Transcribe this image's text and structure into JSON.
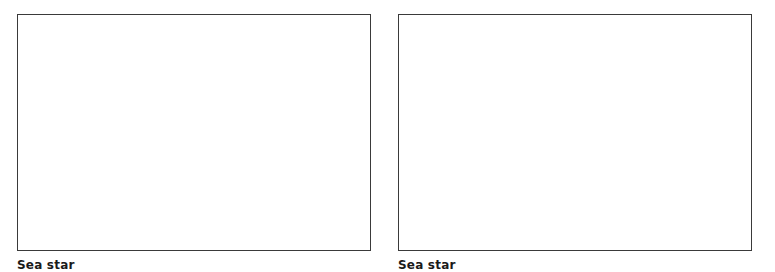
{
  "panels": [
    {
      "caption": "Sea star"
    },
    {
      "caption": "Sea star"
    }
  ]
}
